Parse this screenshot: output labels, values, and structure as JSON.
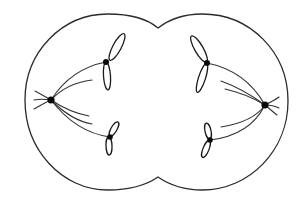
{
  "diagram": {
    "colors": {
      "stroke": "#2a2a2a",
      "background": "#ffffff",
      "centromere": "#0a0a0a"
    },
    "cell_outline": {
      "left_lobe": {
        "cx": 105,
        "cy": 101,
        "r": 78
      },
      "right_lobe": {
        "cx": 200,
        "cy": 101,
        "r": 80
      },
      "cleavage_furrow": {
        "x": 158,
        "top_y": 28,
        "bottom_y": 177
      }
    },
    "poles": [
      {
        "id": "left-pole",
        "x": 51,
        "y": 100
      },
      {
        "id": "right-pole",
        "x": 265,
        "y": 105
      }
    ],
    "chromosomes": [
      {
        "id": "left-upper",
        "x": 106,
        "y": 62
      },
      {
        "id": "left-lower",
        "x": 110,
        "y": 137
      },
      {
        "id": "right-upper",
        "x": 207,
        "y": 63
      },
      {
        "id": "right-lower",
        "x": 210,
        "y": 140
      }
    ]
  }
}
